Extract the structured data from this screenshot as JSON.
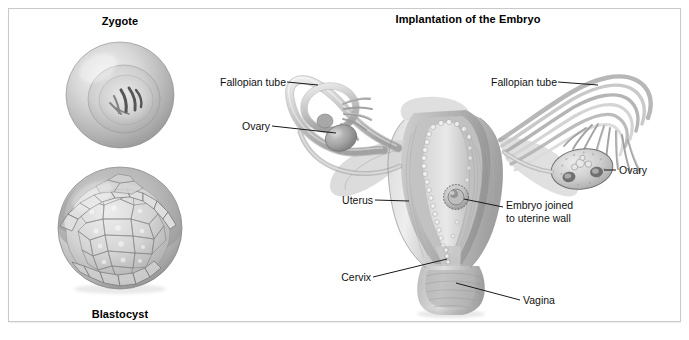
{
  "figure": {
    "background_color": "#ffffff",
    "border_color": "#c9c9c9",
    "width": 689,
    "height": 340
  },
  "left_panel": {
    "zygote_title": "Zygote",
    "blastocyst_title": "Blastocyst"
  },
  "right_panel": {
    "title": "Implantation of the Embryo"
  },
  "labels": {
    "fallopian_tube_left": "Fallopian tube",
    "ovary_left": "Ovary",
    "fallopian_tube_right": "Fallopian tube",
    "ovary_right": "Ovary",
    "uterus": "Uterus",
    "embryo_line1": "Embryo joined",
    "embryo_line2": "to uterine wall",
    "cervix": "Cervix",
    "vagina": "Vagina"
  },
  "illustration": {
    "style": "grayscale medical airbrush illustration",
    "ink_color": "#1a1a1a",
    "tissue_light": "#e3e3e3",
    "tissue_mid": "#bdbdbd",
    "tissue_dark": "#8f8f8f",
    "tissue_shadow": "#6e6e6e"
  }
}
